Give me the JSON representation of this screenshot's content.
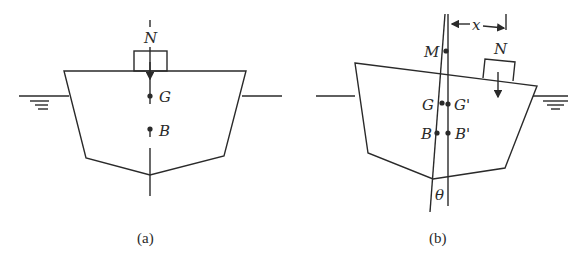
{
  "figure": {
    "panels": [
      {
        "id": "a",
        "caption": "(a)",
        "labels": {
          "load": "N",
          "gravity_center": "G",
          "buoyancy_center": "B"
        }
      },
      {
        "id": "b",
        "caption": "(b)",
        "labels": {
          "metacenter": "M",
          "offset": "x",
          "load": "N",
          "gravity_center": "G",
          "gravity_center_shifted": "G'",
          "buoyancy_center": "B",
          "buoyancy_center_shifted": "B'",
          "heel_angle": "θ"
        }
      }
    ],
    "colors": {
      "stroke": "#2a2a2a",
      "background": "#ffffff"
    }
  }
}
